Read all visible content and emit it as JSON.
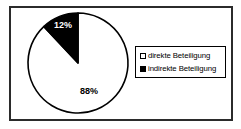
{
  "chart_data": {
    "type": "pie",
    "labels": [
      "direkte Beteiligung",
      "indirekte Beteiligung"
    ],
    "values": [
      88,
      12
    ],
    "data_labels": [
      "88%",
      "12%"
    ],
    "colors": [
      "#ffffff",
      "#000000"
    ],
    "label_colors": [
      "#000000",
      "#ffffff"
    ],
    "stroke_color": "#000000",
    "start": "top",
    "direction": "clockwise",
    "legend_position": "right",
    "title": ""
  }
}
